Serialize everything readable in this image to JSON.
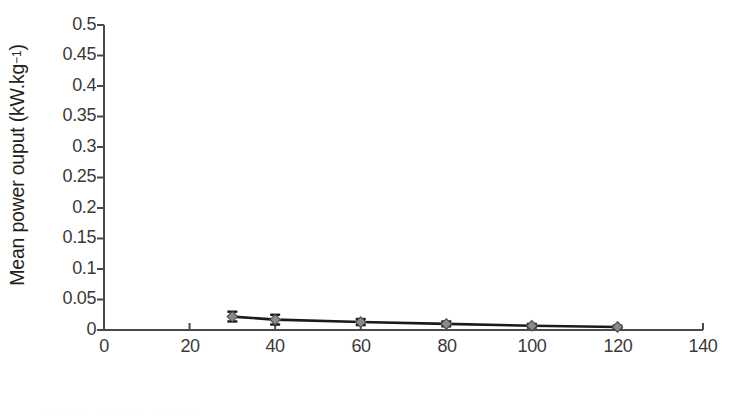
{
  "figure": {
    "background_color": "#ffffff",
    "axis_color": "#4a4a4a",
    "series_line_color": "#1a1a1a",
    "marker_fill_color": "#8a8a8a",
    "marker_edge_color": "#4d4d4d",
    "error_bar_color": "#1a1a1a",
    "bleed_text": "·  ·   ·  ·    ·   ·  ·     ·    ·   ·   ·      ·    ·   ·   ·"
  },
  "chart_data": {
    "type": "line",
    "title": "",
    "xlabel": "Joint angle",
    "ylabel": "Mean power ouput (kW.kg⁻¹)",
    "ylabel_text": "Mean power ouput (kW.kg",
    "ylabel_sup": "−1",
    "ylabel_tail": ")",
    "x": [
      30,
      40,
      60,
      80,
      100,
      120
    ],
    "values": [
      0.022,
      0.017,
      0.013,
      0.01,
      0.007,
      0.005
    ],
    "error_low": [
      0.008,
      0.008,
      0.005,
      0.004,
      0.003,
      0.002
    ],
    "error_high": [
      0.008,
      0.008,
      0.005,
      0.004,
      0.003,
      0.002
    ],
    "series": [
      {
        "name": "Mean power output",
        "x": [
          30,
          40,
          60,
          80,
          100,
          120
        ],
        "values": [
          0.022,
          0.017,
          0.013,
          0.01,
          0.007,
          0.005
        ],
        "error_low": [
          0.008,
          0.008,
          0.005,
          0.004,
          0.003,
          0.002
        ],
        "error_high": [
          0.008,
          0.008,
          0.005,
          0.004,
          0.003,
          0.002
        ],
        "marker": "diamond",
        "line_style": "solid"
      }
    ],
    "xlim": [
      0,
      140
    ],
    "ylim": [
      0,
      0.5
    ],
    "xticks": [
      0,
      20,
      40,
      60,
      80,
      100,
      120,
      140
    ],
    "xtick_labels": [
      "0",
      "20",
      "40",
      "60",
      "80",
      "100",
      "120",
      "140"
    ],
    "yticks": [
      0,
      0.05,
      0.1,
      0.15,
      0.2,
      0.25,
      0.3,
      0.35,
      0.4,
      0.45,
      0.5
    ],
    "ytick_labels": [
      "0",
      "0.05",
      "0.1",
      "0.15",
      "0.2",
      "0.25",
      "0.3",
      "0.35",
      "0.4",
      "0.45",
      "0.5"
    ],
    "grid": false,
    "legend": null,
    "legend_position": "none",
    "annotations": []
  }
}
